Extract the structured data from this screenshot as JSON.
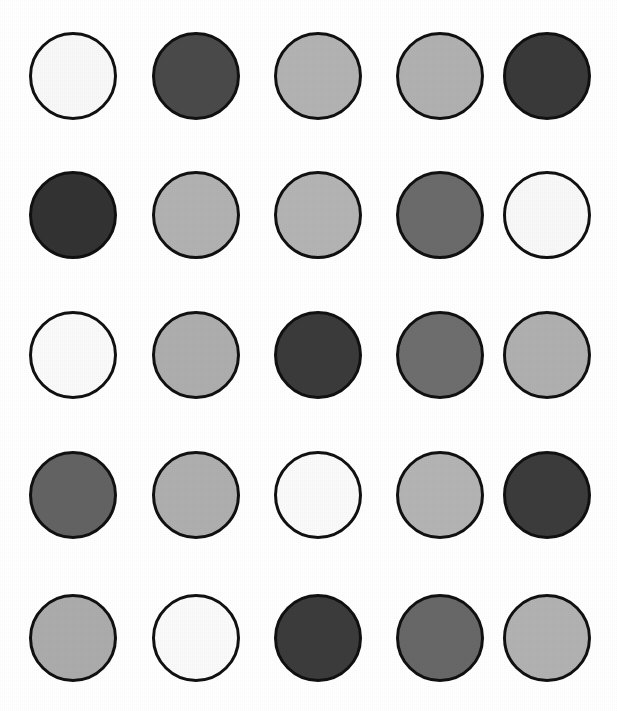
{
  "image": {
    "title": "Grayscale Circle Grid",
    "background_color": "#ffffff",
    "width": 617,
    "height": 711,
    "outline_color": "#111111",
    "outline_width_px": 3,
    "rows": 5,
    "columns": 5,
    "circle_diameter_px": 88
  },
  "layout": {
    "column_centers_px": [
      73,
      196,
      318,
      440,
      547
    ],
    "row_centers_px": [
      76,
      215,
      355,
      495,
      638
    ]
  },
  "chart_data": {
    "type": "heatmap",
    "xlabel": "",
    "ylabel": "",
    "grid": false,
    "legend": "none",
    "categories": [
      "Col 1",
      "Col 2",
      "Col 3",
      "Col 4",
      "Col 5"
    ],
    "row_labels": [
      "Row 1",
      "Row 2",
      "Row 3",
      "Row 4",
      "Row 5"
    ],
    "value_unit": "gray level (0-255)",
    "series": [
      {
        "name": "Row 1",
        "values": [
          248,
          74,
          179,
          177,
          58
        ]
      },
      {
        "name": "Row 2",
        "values": [
          51,
          178,
          180,
          107,
          248
        ]
      },
      {
        "name": "Row 3",
        "values": [
          250,
          174,
          59,
          110,
          176
        ]
      },
      {
        "name": "Row 4",
        "values": [
          99,
          175,
          250,
          180,
          60
        ]
      },
      {
        "name": "Row 5",
        "values": [
          172,
          250,
          60,
          104,
          178
        ]
      }
    ]
  },
  "circles": [
    {
      "id": "circle-r1c1",
      "row": 1,
      "col": 1,
      "fill": "#f8f8f8",
      "gray": 248,
      "shade": "near-white"
    },
    {
      "id": "circle-r1c2",
      "row": 1,
      "col": 2,
      "fill": "#4a4a4a",
      "gray": 74,
      "shade": "dark-gray"
    },
    {
      "id": "circle-r1c3",
      "row": 1,
      "col": 3,
      "fill": "#b3b3b3",
      "gray": 179,
      "shade": "light-gray"
    },
    {
      "id": "circle-r1c4",
      "row": 1,
      "col": 4,
      "fill": "#b1b1b1",
      "gray": 177,
      "shade": "light-gray"
    },
    {
      "id": "circle-r1c5",
      "row": 1,
      "col": 5,
      "fill": "#3a3a3a",
      "gray": 58,
      "shade": "very-dark-gray"
    },
    {
      "id": "circle-r2c1",
      "row": 2,
      "col": 1,
      "fill": "#333333",
      "gray": 51,
      "shade": "very-dark-gray"
    },
    {
      "id": "circle-r2c2",
      "row": 2,
      "col": 2,
      "fill": "#b2b2b2",
      "gray": 178,
      "shade": "light-gray"
    },
    {
      "id": "circle-r2c3",
      "row": 2,
      "col": 3,
      "fill": "#b4b4b4",
      "gray": 180,
      "shade": "light-gray"
    },
    {
      "id": "circle-r2c4",
      "row": 2,
      "col": 4,
      "fill": "#6b6b6b",
      "gray": 107,
      "shade": "medium-dark-gray"
    },
    {
      "id": "circle-r2c5",
      "row": 2,
      "col": 5,
      "fill": "#f8f8f8",
      "gray": 248,
      "shade": "near-white"
    },
    {
      "id": "circle-r3c1",
      "row": 3,
      "col": 1,
      "fill": "#fafafa",
      "gray": 250,
      "shade": "near-white"
    },
    {
      "id": "circle-r3c2",
      "row": 3,
      "col": 2,
      "fill": "#aeaeae",
      "gray": 174,
      "shade": "light-gray"
    },
    {
      "id": "circle-r3c3",
      "row": 3,
      "col": 3,
      "fill": "#3b3b3b",
      "gray": 59,
      "shade": "very-dark-gray"
    },
    {
      "id": "circle-r3c4",
      "row": 3,
      "col": 4,
      "fill": "#6e6e6e",
      "gray": 110,
      "shade": "medium-dark-gray"
    },
    {
      "id": "circle-r3c5",
      "row": 3,
      "col": 5,
      "fill": "#b0b0b0",
      "gray": 176,
      "shade": "light-gray"
    },
    {
      "id": "circle-r4c1",
      "row": 4,
      "col": 1,
      "fill": "#636363",
      "gray": 99,
      "shade": "medium-dark-gray"
    },
    {
      "id": "circle-r4c2",
      "row": 4,
      "col": 2,
      "fill": "#afafaf",
      "gray": 175,
      "shade": "light-gray"
    },
    {
      "id": "circle-r4c3",
      "row": 4,
      "col": 3,
      "fill": "#fafafa",
      "gray": 250,
      "shade": "near-white"
    },
    {
      "id": "circle-r4c4",
      "row": 4,
      "col": 4,
      "fill": "#b4b4b4",
      "gray": 180,
      "shade": "light-gray"
    },
    {
      "id": "circle-r4c5",
      "row": 4,
      "col": 5,
      "fill": "#3c3c3c",
      "gray": 60,
      "shade": "very-dark-gray"
    },
    {
      "id": "circle-r5c1",
      "row": 5,
      "col": 1,
      "fill": "#acacac",
      "gray": 172,
      "shade": "light-gray"
    },
    {
      "id": "circle-r5c2",
      "row": 5,
      "col": 2,
      "fill": "#fafafa",
      "gray": 250,
      "shade": "near-white"
    },
    {
      "id": "circle-r5c3",
      "row": 5,
      "col": 3,
      "fill": "#3c3c3c",
      "gray": 60,
      "shade": "very-dark-gray"
    },
    {
      "id": "circle-r5c4",
      "row": 5,
      "col": 4,
      "fill": "#686868",
      "gray": 104,
      "shade": "medium-dark-gray"
    },
    {
      "id": "circle-r5c5",
      "row": 5,
      "col": 5,
      "fill": "#b2b2b2",
      "gray": 178,
      "shade": "light-gray"
    }
  ]
}
